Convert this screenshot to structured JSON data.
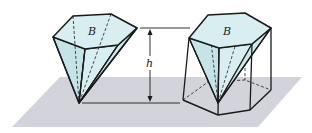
{
  "figure": {
    "labels": {
      "base_left": "B",
      "base_right": "B",
      "height": "h"
    },
    "colors": {
      "plane": "#d3d3dc",
      "face_fill": "#d8eef0",
      "face_fill_dark": "#c6e4e8",
      "stroke": "#1a1a1a"
    }
  }
}
